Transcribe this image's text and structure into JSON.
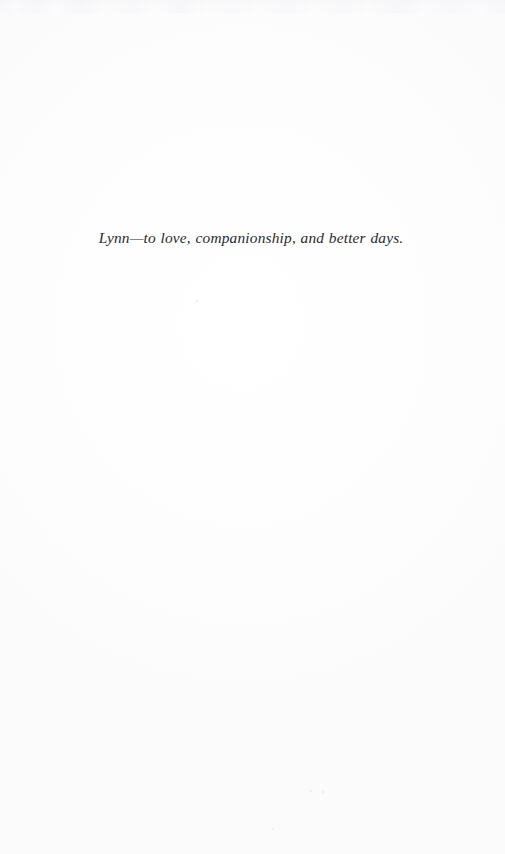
{
  "page": {
    "kind": "book-dedication-page",
    "background_color": "#fefefe",
    "width": 505,
    "height": 854
  },
  "dedication": {
    "text": "Lynn—to love, companionship, and better days.",
    "color": "#2a2a2e",
    "style": "italic-serif"
  },
  "artifacts": {
    "top_edge_label": "scan-artifact-band",
    "specks": [
      {
        "x": 196,
        "y": 300,
        "size": 1.6,
        "opacity": 0.3
      },
      {
        "x": 310,
        "y": 790,
        "size": 2.0,
        "opacity": 0.4
      },
      {
        "x": 322,
        "y": 791,
        "size": 2.2,
        "opacity": 0.42
      },
      {
        "x": 272,
        "y": 828,
        "size": 1.5,
        "opacity": 0.26
      },
      {
        "x": 180,
        "y": 548,
        "size": 1.4,
        "opacity": 0.22
      },
      {
        "x": 92,
        "y": 838,
        "size": 1.3,
        "opacity": 0.2
      },
      {
        "x": 436,
        "y": 845,
        "size": 1.3,
        "opacity": 0.18
      },
      {
        "x": 498,
        "y": 612,
        "size": 1.4,
        "opacity": 0.2
      }
    ]
  }
}
